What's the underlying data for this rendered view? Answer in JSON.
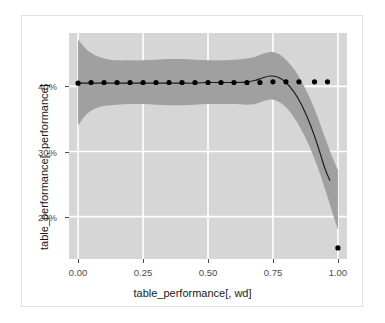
{
  "chart_data": {
    "type": "scatter",
    "title": "",
    "xlabel": "table_performance[, wd]",
    "ylabel": "table_performance[, performance]",
    "xlim": [
      -0.035,
      1.035
    ],
    "ylim": [
      0.135,
      0.482
    ],
    "xticks": [
      0.0,
      0.25,
      0.5,
      0.75,
      1.0
    ],
    "xticklabels": [
      "0.00",
      "0.25",
      "0.50",
      "0.75",
      "1.00"
    ],
    "yticks": [
      0.2,
      0.3,
      0.4
    ],
    "yticklabels": [
      "20%",
      "30%",
      "40%"
    ],
    "grid": true,
    "legend": null,
    "panel_background": "#d6d6d6",
    "gridline_color": "#ffffff",
    "point_color": "#000000",
    "line_color": "#1a1a1a",
    "ribbon_color": "#a0a0a0",
    "series": [
      {
        "name": "points",
        "type": "scatter",
        "x": [
          0.0,
          0.05,
          0.1,
          0.15,
          0.2,
          0.25,
          0.3,
          0.35,
          0.4,
          0.45,
          0.5,
          0.55,
          0.6,
          0.65,
          0.7,
          0.75,
          0.8,
          0.85,
          0.91,
          0.96,
          1.0
        ],
        "y": [
          0.405,
          0.406,
          0.406,
          0.406,
          0.406,
          0.406,
          0.406,
          0.406,
          0.406,
          0.406,
          0.406,
          0.406,
          0.406,
          0.406,
          0.406,
          0.407,
          0.407,
          0.407,
          0.407,
          0.407,
          0.152
        ]
      },
      {
        "name": "loess-fit",
        "type": "line",
        "x": [
          0.0,
          0.05,
          0.1,
          0.15,
          0.2,
          0.25,
          0.3,
          0.35,
          0.4,
          0.45,
          0.5,
          0.55,
          0.6,
          0.65,
          0.68,
          0.71,
          0.74,
          0.77,
          0.8,
          0.83,
          0.86,
          0.89,
          0.92,
          0.95,
          0.97
        ],
        "y": [
          0.405,
          0.405,
          0.405,
          0.405,
          0.405,
          0.405,
          0.405,
          0.405,
          0.405,
          0.405,
          0.406,
          0.406,
          0.406,
          0.407,
          0.409,
          0.413,
          0.416,
          0.414,
          0.406,
          0.392,
          0.372,
          0.345,
          0.312,
          0.274,
          0.255
        ]
      },
      {
        "name": "confidence-ribbon-upper",
        "type": "area",
        "x": [
          0.0,
          0.03,
          0.06,
          0.1,
          0.15,
          0.2,
          0.25,
          0.3,
          0.35,
          0.4,
          0.45,
          0.5,
          0.55,
          0.6,
          0.65,
          0.68,
          0.71,
          0.74,
          0.77,
          0.8,
          0.83,
          0.86,
          0.89,
          0.92,
          0.95,
          0.98,
          1.0
        ],
        "y": [
          0.472,
          0.458,
          0.449,
          0.443,
          0.44,
          0.44,
          0.44,
          0.441,
          0.442,
          0.442,
          0.441,
          0.44,
          0.44,
          0.441,
          0.443,
          0.445,
          0.45,
          0.453,
          0.45,
          0.441,
          0.427,
          0.408,
          0.384,
          0.355,
          0.322,
          0.29,
          0.272
        ]
      },
      {
        "name": "confidence-ribbon-lower",
        "type": "area",
        "x": [
          0.0,
          0.03,
          0.06,
          0.1,
          0.15,
          0.2,
          0.25,
          0.3,
          0.35,
          0.4,
          0.45,
          0.5,
          0.55,
          0.6,
          0.65,
          0.68,
          0.71,
          0.74,
          0.77,
          0.8,
          0.83,
          0.86,
          0.89,
          0.92,
          0.95,
          0.98,
          1.0
        ],
        "y": [
          0.34,
          0.356,
          0.365,
          0.37,
          0.372,
          0.373,
          0.373,
          0.372,
          0.371,
          0.371,
          0.372,
          0.373,
          0.373,
          0.373,
          0.372,
          0.373,
          0.377,
          0.38,
          0.377,
          0.368,
          0.353,
          0.333,
          0.308,
          0.278,
          0.243,
          0.205,
          0.18
        ]
      }
    ]
  },
  "axes": {
    "x_title": "table_performance[, wd]",
    "y_title": "table_performance[, performance]",
    "x_tick_labels": [
      "0.00",
      "0.25",
      "0.50",
      "0.75",
      "1.00"
    ],
    "y_tick_labels": [
      "40%",
      "30%",
      "20%"
    ]
  }
}
